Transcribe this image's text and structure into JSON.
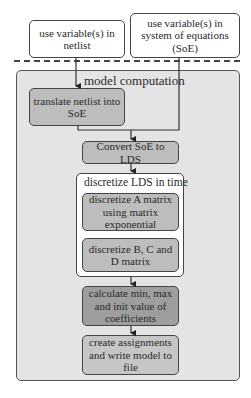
{
  "inputs": {
    "netlist": "use variable(s) in netlist",
    "soe": "use variable(s) in system of equations (SoE)"
  },
  "container": {
    "title": "model computation"
  },
  "steps": {
    "translate": "translate netlist into SoE",
    "convert": "Convert SoE to LDS",
    "discretize_group": {
      "title": "discretize LDS in time",
      "a_matrix": "discretize A matrix using matrix exponential",
      "bcd_matrix": "discretize B, C and D matrix"
    },
    "calculate": "calculate min, max and init value of coefficients",
    "create": "create assignments and write model to file"
  },
  "colors": {
    "container_bg": "#e4e4e4",
    "box_mid": "#bdbdbd",
    "box_dark": "#9e9e9e",
    "box_light": "#c6c6c6",
    "line": "#333333"
  }
}
